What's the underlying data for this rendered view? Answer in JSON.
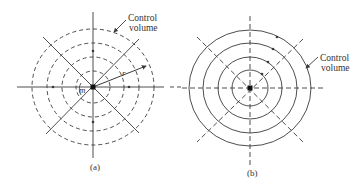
{
  "figure": {
    "width": 364,
    "height": 189,
    "colors": {
      "stroke": "#3a3a3a",
      "text": "#333333",
      "background": "#ffffff"
    }
  },
  "panels": [
    {
      "id": "a",
      "caption": "(a)",
      "caption_pos": [
        90,
        170
      ],
      "center": [
        93,
        87
      ],
      "circle_style": "dashed",
      "circles": [
        {
          "rx": 17,
          "ry": 16
        },
        {
          "rx": 31,
          "ry": 30
        },
        {
          "rx": 46,
          "ry": 44
        },
        {
          "rx": 61,
          "ry": 58
        }
      ],
      "axis_style": "solid",
      "axes": [
        {
          "x1": 17,
          "y1": 87,
          "x2": 164,
          "y2": 87
        },
        {
          "x1": 93,
          "y1": 12,
          "x2": 93,
          "y2": 158
        },
        {
          "x1": 43,
          "y1": 37,
          "x2": 139,
          "y2": 133
        },
        {
          "x1": 139,
          "y1": 39,
          "x2": 46,
          "y2": 134
        }
      ],
      "dashed_extension": {
        "x1": 170,
        "y1": 87,
        "x2": 182,
        "y2": 87
      },
      "flow_direction": "radially inward",
      "flow_arrows": [
        [
          53,
          87,
          -1
        ],
        [
          129,
          87,
          1
        ],
        [
          93,
          51,
          -1
        ],
        [
          93,
          122,
          1
        ]
      ],
      "radius_vector": {
        "from": [
          93,
          87
        ],
        "to": [
          146,
          66
        ],
        "label": "r",
        "label_pos": [
          122,
          76
        ]
      },
      "mass_label": {
        "text": "m",
        "pos": [
          79,
          93
        ]
      },
      "control_volume_label": {
        "lines": [
          "Control",
          "volume"
        ],
        "pos": [
          128,
          13
        ],
        "leader_from": [
          126,
          20
        ],
        "leader_to": [
          114,
          32
        ]
      }
    },
    {
      "id": "b",
      "caption": "(b)",
      "caption_pos": [
        247,
        176
      ],
      "center": [
        250,
        88
      ],
      "circle_style": "solid",
      "circles": [
        {
          "rx": 18,
          "ry": 18
        },
        {
          "rx": 32,
          "ry": 31
        },
        {
          "rx": 47,
          "ry": 45
        },
        {
          "rx": 61,
          "ry": 58
        }
      ],
      "axis_style": "dashed",
      "axes": [
        {
          "x1": 182,
          "y1": 88,
          "x2": 326,
          "y2": 88
        },
        {
          "x1": 250,
          "y1": 16,
          "x2": 250,
          "y2": 165
        },
        {
          "x1": 197,
          "y1": 37,
          "x2": 303,
          "y2": 142
        },
        {
          "x1": 303,
          "y1": 39,
          "x2": 197,
          "y2": 142
        }
      ],
      "flow_direction": "counterclockwise circulation",
      "flow_arrows": [
        [
          277,
          37
        ],
        [
          273,
          49
        ],
        [
          268,
          62
        ],
        [
          262,
          74
        ]
      ],
      "mass_label": null,
      "control_volume_label": {
        "lines": [
          "Control",
          "volume"
        ],
        "pos": [
          320,
          53
        ],
        "leader_from": [
          318,
          57
        ],
        "leader_to": [
          306,
          68
        ]
      }
    }
  ],
  "text": {
    "control_volume_line1": "Control",
    "control_volume_line2": "volume",
    "caption_a": "(a)",
    "caption_b": "(b)",
    "radius_label": "r",
    "mass_label": "m"
  }
}
